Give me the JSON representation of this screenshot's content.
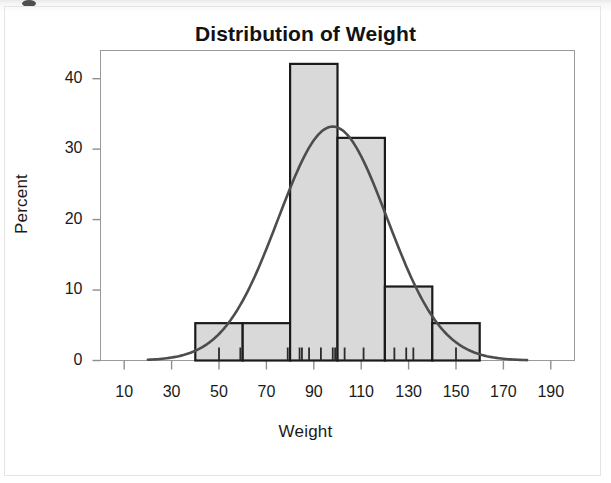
{
  "figure": {
    "title": "Distribution of Weight"
  },
  "chart_data": {
    "type": "bar",
    "subtype": "histogram-with-normal-curve",
    "title": "Distribution of Weight",
    "xlabel": "Weight",
    "ylabel": "Percent",
    "xlim": [
      0,
      200
    ],
    "ylim": [
      0,
      44
    ],
    "xticks": [
      10,
      30,
      50,
      70,
      90,
      110,
      130,
      150,
      170,
      190
    ],
    "ytick_labels": [
      "0",
      "10",
      "20",
      "30",
      "40"
    ],
    "yticks": [
      0,
      10,
      20,
      30,
      40
    ],
    "grid": false,
    "legend": null,
    "bin_width": 20,
    "bin_edges": [
      40,
      60,
      80,
      100,
      120,
      140,
      160
    ],
    "categories": [
      "40-60",
      "60-80",
      "80-100",
      "100-120",
      "120-140",
      "140-160"
    ],
    "bin_centers": [
      50,
      70,
      90,
      110,
      130,
      150
    ],
    "values": [
      5.3,
      5.3,
      42.1,
      31.6,
      10.5,
      5.3
    ],
    "bar_fill": "#d9d9d9",
    "bar_edge": "#1a1a1a",
    "curve": {
      "name": "Normal density",
      "color": "#4d4d4d",
      "mean": 98,
      "std": 23,
      "peak_percent": 33.2,
      "x_start": 20,
      "x_end": 180
    },
    "rug_marks": [
      50,
      59,
      79,
      84,
      85,
      88,
      93,
      98,
      99,
      103,
      111,
      124,
      129,
      132,
      150
    ]
  },
  "axis": {
    "x_tick_labels": [
      "10",
      "30",
      "50",
      "70",
      "90",
      "110",
      "130",
      "150",
      "170",
      "190"
    ],
    "y_tick_labels": [
      "0",
      "10",
      "20",
      "30",
      "40"
    ],
    "x_title": "Weight",
    "y_title": "Percent"
  }
}
